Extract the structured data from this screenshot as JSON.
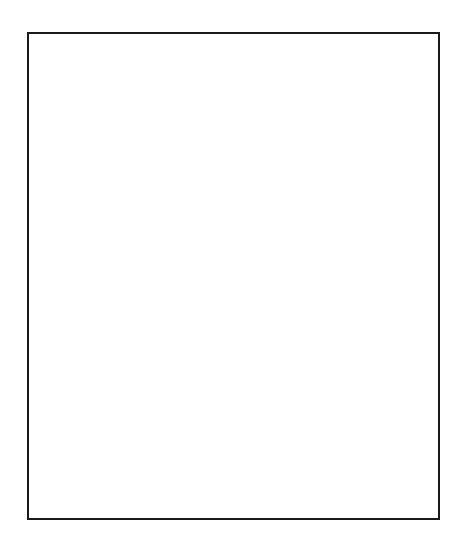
{
  "figure": {
    "domain": "scientific-illustration",
    "caption": "",
    "width": 468,
    "height": 555,
    "background_color": "#ffffff"
  },
  "frame": {
    "name": "figure-border",
    "x": 27,
    "y": 32,
    "width": 409,
    "height": 484,
    "stroke_color": "#1a1a1a",
    "stroke_width": 2,
    "fill": "#ffffff"
  },
  "chart_data": {
    "type": "quiver",
    "subtitle": "",
    "xlabel": "",
    "ylabel": "",
    "legend": [],
    "grid": false,
    "axis_visible": false,
    "xlim": [
      27,
      440
    ],
    "ylim": [
      32,
      520
    ],
    "grid_spacing_px": 15,
    "arrow_length_px": 13,
    "arrow_color": "#3b3b3b",
    "arrow_head_length_px": 5,
    "regions": [
      {
        "name": "femoral-head",
        "description": "Superior-medial spherical head; vectors point inferiorly and inferio-medially",
        "mean_direction_deg": 100,
        "grayscale": "#9a9a9a"
      },
      {
        "name": "femoral-neck",
        "description": "Diagonal neck connecting head to trochanteric region; vectors fan from down-left to down-right",
        "mean_direction_deg": 95,
        "grayscale": "#808080"
      },
      {
        "name": "greater-trochanter",
        "description": "Superior-lateral prominence; vectors point superiorly-laterally and laterally",
        "mean_direction_deg": 330,
        "grayscale": "#d2d2d2"
      },
      {
        "name": "trochanteric-fossa",
        "description": "Concave notch between head/neck and greater trochanter",
        "mean_direction_deg": 350,
        "grayscale": "#e0e0e0"
      },
      {
        "name": "medial-shaft-cortex",
        "description": "Dark medial calcar region; vectors point straight inferiorly",
        "mean_direction_deg": 90,
        "grayscale": "#4e4e4e"
      },
      {
        "name": "lateral-shaft",
        "description": "Lateral shaft below trochanter; vectors point superiorly",
        "mean_direction_deg": 275,
        "grayscale": "#c8c8c8"
      },
      {
        "name": "distal-cut-plane",
        "description": "Transverse cut at distal end of modelled region; arrows exit inferiorly",
        "mean_direction_deg": 90,
        "grayscale": "#6f6f6f"
      }
    ],
    "density_scale": {
      "min_gray": "#3c3c3c",
      "max_gray": "#f2f2f2",
      "description": "Grayscale encodes bone mineral density / material stiffness; darker = higher"
    }
  },
  "silhouette": {
    "name": "proximal-femur-outline",
    "path": "M 150 58 C 120 60 96 78 84 105 C 74 128 72 152 75 176 C 77 196 80 212 83 224 C 92 228 104 229 116 227 C 131 225 146 221 158 222 C 172 223 182 232 190 246 C 198 260 203 276 206 292 C 208 308 206 322 200 336 C 193 352 186 366 184 380 C 182 394 186 406 192 418 C 198 430 203 442 205 456 L 205 493 L 345 493 C 352 470 358 448 362 426 C 367 400 370 376 374 354 C 378 332 383 312 390 296 C 396 282 402 270 404 256 C 406 242 403 228 396 216 C 389 204 380 194 372 186 C 364 178 356 172 350 166 C 344 160 340 154 336 150 C 330 144 322 142 314 146 C 306 150 300 158 294 166 C 287 175 280 184 272 190 C 262 198 250 200 238 196 C 226 192 216 184 208 172 C 200 160 194 146 188 130 C 182 114 176 98 170 84 C 164 70 158 60 150 58 Z",
    "fill": "url(#bone-gradient)"
  },
  "vector_field": {
    "name": "trabecular-vectors",
    "count_approx": 520,
    "spacing": 15,
    "length": 13,
    "color": "#3b3b3b",
    "line_width": 1.4
  }
}
